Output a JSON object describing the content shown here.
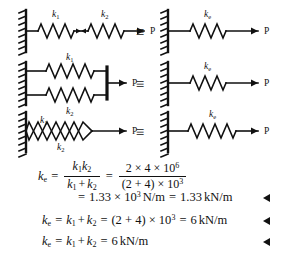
{
  "figure": {
    "force_label": "P",
    "equivalence_symbol": "≡",
    "rows": [
      {
        "id": "series",
        "arrangement": "two-springs-in-series",
        "left_labels": [
          "k",
          "k"
        ],
        "left_label_subs": [
          "1",
          "2"
        ],
        "right_label": "k",
        "right_label_sub": "e",
        "force": "P"
      },
      {
        "id": "parallel-stacked",
        "arrangement": "two-springs-in-parallel-stacked-with-rigid-bar",
        "left_labels": [
          "k",
          "k"
        ],
        "left_label_subs": [
          "1",
          "2"
        ],
        "right_label": "k",
        "right_label_sub": "e",
        "force": "P"
      },
      {
        "id": "parallel-overlapped",
        "arrangement": "two-springs-in-parallel-overlapping",
        "left_labels": [
          "k",
          "k"
        ],
        "left_label_subs": [
          "1",
          "2"
        ],
        "right_label": "k",
        "right_label_sub": "e",
        "force": "P"
      }
    ]
  },
  "equations": {
    "line1": {
      "lhs_var": "k",
      "lhs_sub": "e",
      "eq1": "=",
      "frac1_num_a": "k",
      "frac1_num_a_sub": "1",
      "frac1_num_b": "k",
      "frac1_num_b_sub": "2",
      "frac1_den_a": "k",
      "frac1_den_a_sub": "1",
      "frac1_den_plus": "+",
      "frac1_den_b": "k",
      "frac1_den_b_sub": "2",
      "eq2": "=",
      "frac2_num": "2 × 4 × 10",
      "frac2_num_sup": "6",
      "frac2_den": "(2 + 4) × 10",
      "frac2_den_sup": "3"
    },
    "line2": {
      "eq": "=",
      "value": "1.33 × 10",
      "value_sup": "3",
      "unit": "N/m",
      "eq2": "=",
      "value2": "1.33",
      "unit2": "kN/m"
    },
    "line3": {
      "lhs_var": "k",
      "lhs_sub": "e",
      "eq1": "=",
      "term_a": "k",
      "term_a_sub": "1",
      "plus": "+",
      "term_b": "k",
      "term_b_sub": "2",
      "eq2": "=",
      "expr": "(2 + 4) × 10",
      "expr_sup": "3",
      "eq3": "=",
      "result": "6",
      "unit": "kN/m"
    },
    "line4": {
      "lhs_var": "k",
      "lhs_sub": "e",
      "eq1": "=",
      "term_a": "k",
      "term_a_sub": "1",
      "plus": "+",
      "term_b": "k",
      "term_b_sub": "2",
      "eq2": "=",
      "result": "6",
      "unit": "kN/m"
    },
    "answer_marker": "◀"
  },
  "colors": {
    "ink": "#111111",
    "background": "#ffffff"
  }
}
